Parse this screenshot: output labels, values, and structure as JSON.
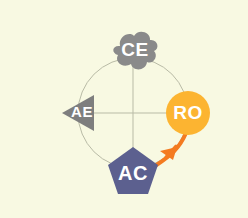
{
  "diagram": {
    "background_color": "#f8f9e2",
    "circle": {
      "name": "guide-circle",
      "center_x": 133,
      "center_y": 113,
      "radius": 55,
      "stroke_color": "#b9bba6",
      "stroke_width": 1
    },
    "axes": {
      "name": "crosshair-axes",
      "stroke_color": "#b9bba6",
      "stroke_width": 1,
      "horizontal": {
        "x1": 78,
        "y1": 113,
        "x2": 188,
        "y2": 113
      },
      "vertical": {
        "x1": 133,
        "y1": 58,
        "x2": 133,
        "y2": 168
      }
    },
    "nodes": [
      {
        "id": "ce",
        "label": "CE",
        "shape": "cloud",
        "position": "top",
        "cx": 133,
        "cy": 58,
        "fill": "#8a8a8a",
        "text_color": "#ffffff",
        "font_size": 19
      },
      {
        "id": "ae",
        "label": "AE",
        "shape": "triangle-left",
        "position": "left",
        "cx": 80,
        "cy": 113,
        "fill": "#7e7e7e",
        "text_color": "#ffffff",
        "font_size": 15
      },
      {
        "id": "ro",
        "label": "RO",
        "shape": "circle",
        "position": "right",
        "cx": 188,
        "cy": 113,
        "fill": "#fcb431",
        "text_color": "#ffffff",
        "font_size": 19
      },
      {
        "id": "ac",
        "label": "AC",
        "shape": "pentagon",
        "position": "bottom",
        "cx": 133,
        "cy": 170,
        "fill": "#5c608f",
        "text_color": "#ffffff",
        "font_size": 20
      }
    ],
    "arrow": {
      "name": "ro-to-ac-arrow",
      "from": "RO",
      "to": "AC",
      "color": "#f47b20",
      "stroke_width": 4
    }
  }
}
